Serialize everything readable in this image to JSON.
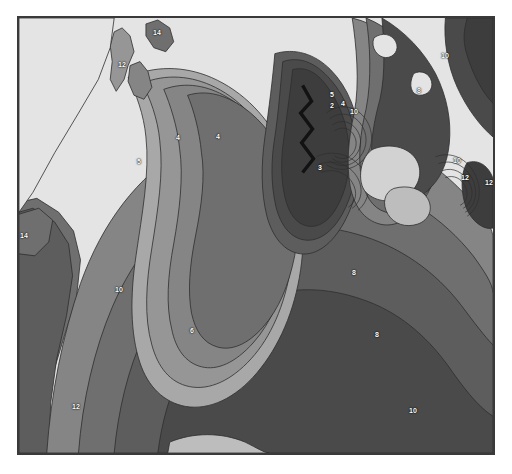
{
  "map": {
    "type": "contour-map",
    "title": "",
    "background_color": "#d9d9d9",
    "frame_color": "#3a3a3a",
    "contour_labels": [
      {
        "value": "12",
        "x": 120,
        "y": 62
      },
      {
        "value": "14",
        "x": 155,
        "y": 30
      },
      {
        "value": "4",
        "x": 176,
        "y": 135
      },
      {
        "value": "4",
        "x": 216,
        "y": 134
      },
      {
        "value": "5",
        "x": 137,
        "y": 159
      },
      {
        "value": "3",
        "x": 318,
        "y": 165
      },
      {
        "value": "2",
        "x": 330,
        "y": 103
      },
      {
        "value": "14",
        "x": 20,
        "y": 233
      },
      {
        "value": "10",
        "x": 117,
        "y": 287
      },
      {
        "value": "6",
        "x": 190,
        "y": 328
      },
      {
        "value": "12",
        "x": 74,
        "y": 404
      },
      {
        "value": "8",
        "x": 375,
        "y": 332
      },
      {
        "value": "10",
        "x": 411,
        "y": 408
      },
      {
        "value": "8",
        "x": 352,
        "y": 270
      },
      {
        "value": "10",
        "x": 443,
        "y": 53
      },
      {
        "value": "8",
        "x": 417,
        "y": 88
      },
      {
        "value": "10",
        "x": 455,
        "y": 158
      },
      {
        "value": "12",
        "x": 463,
        "y": 175
      },
      {
        "value": "12",
        "x": 487,
        "y": 180
      },
      {
        "value": "10",
        "x": 352,
        "y": 109
      },
      {
        "value": "5",
        "x": 330,
        "y": 92
      },
      {
        "value": "4",
        "x": 341,
        "y": 101
      }
    ],
    "fault_rupture": {
      "label": "Zone of fault rupture",
      "symbol": "zigzag-line",
      "points": "304,85 310,100 300,110 312,124 302,134 312,148 303,158"
    }
  },
  "legend": {
    "symbol_name": "fault-rupture-zigzag-icon",
    "text": "Zone of fault rupture"
  },
  "palette": {
    "band_1_lightest": "#e4e4e4",
    "band_2": "#d2d2d2",
    "band_3": "#bdbdbd",
    "band_4": "#a8a8a8",
    "band_5": "#969696",
    "band_6": "#858585",
    "band_7": "#6f6f6f",
    "band_8": "#5d5d5d",
    "band_9_darkest": "#4a4a4a",
    "core": "#3d3d3d",
    "outline": "#2e2e2e",
    "label_text": "#ffffff",
    "frame": "#3a3a3a",
    "page_background": "#ffffff"
  }
}
